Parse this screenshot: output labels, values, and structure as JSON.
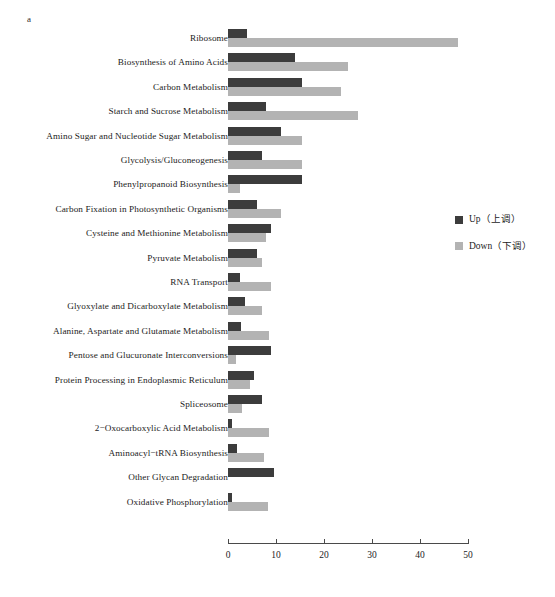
{
  "panel": {
    "label": "a"
  },
  "legend": {
    "position": "right",
    "items": [
      {
        "name": "up",
        "label": "Up（上调）",
        "color": "#3c3c3c"
      },
      {
        "name": "down",
        "label": "Down（下调）",
        "color": "#b3b3b3"
      }
    ]
  },
  "axis": {
    "ticks": [
      "0",
      "10",
      "20",
      "30",
      "40",
      "50"
    ],
    "tick_values": [
      0,
      10,
      20,
      30,
      40,
      50
    ],
    "min": 0,
    "max": 50
  },
  "chart_data": {
    "type": "bar",
    "orientation": "horizontal",
    "title": "",
    "subtitle": "",
    "xlabel": "",
    "ylabel": "",
    "xlim": [
      0,
      50
    ],
    "grid": false,
    "legend_position": "right",
    "categories": [
      "Ribosome",
      "Biosynthesis of Amino Acids",
      "Carbon Metabolism",
      "Starch and Sucrose Metabolism",
      "Amino Sugar and Nucleotide Sugar Metabolism",
      "Glycolysis/Gluconeogenesis",
      "Phenylpropanoid Biosynthesis",
      "Carbon Fixation in Photosynthetic Organisms",
      "Cysteine and Methionine Metabolism",
      "Pyruvate Metabolism",
      "RNA Transport",
      "Glyoxylate and Dicarboxylate Metabolism",
      "Alanine, Aspartate and Glutamate Metabolism",
      "Pentose and Glucuronate Interconversions",
      "Protein Processing in Endoplasmic Reticulum",
      "Spliceosome",
      "2−Oxocarboxylic Acid Metabolism",
      "Aminoacyl−tRNA Biosynthesis",
      "Other Glycan Degradation",
      "Oxidative Phosphorylation"
    ],
    "series": [
      {
        "name": "Up（上调）",
        "color": "#3c3c3c",
        "values": [
          4,
          14,
          15.5,
          8,
          11,
          7,
          15.5,
          6,
          9,
          6,
          2.5,
          3.5,
          2.7,
          9,
          5.5,
          7,
          0.8,
          1.8,
          9.5,
          0.8
        ]
      },
      {
        "name": "Down（下调）",
        "color": "#b3b3b3",
        "values": [
          48,
          25,
          23.5,
          27,
          15.5,
          15.5,
          2.5,
          11,
          8,
          7,
          9,
          7,
          8.5,
          1.7,
          4.5,
          3,
          8.5,
          7.5,
          0,
          8.3
        ]
      }
    ]
  }
}
